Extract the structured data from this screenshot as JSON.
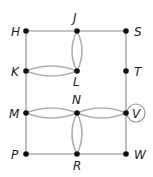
{
  "graph": {
    "colors": {
      "edge": "#b0b0b0",
      "node": "#111111",
      "label": "#222222",
      "highlight_ring": "#999999"
    },
    "nodes": [
      {
        "id": "H",
        "label": "H",
        "x": 26,
        "y": 31,
        "label_dx": -15,
        "label_dy": 5
      },
      {
        "id": "J",
        "label": "J",
        "x": 77,
        "y": 31,
        "label_dx": -4,
        "label_dy": -9
      },
      {
        "id": "S",
        "label": "S",
        "x": 126,
        "y": 31,
        "label_dx": 8,
        "label_dy": 5
      },
      {
        "id": "K",
        "label": "K",
        "x": 26,
        "y": 71,
        "label_dx": -15,
        "label_dy": 5
      },
      {
        "id": "L",
        "label": "L",
        "x": 77,
        "y": 71,
        "label_dx": -4,
        "label_dy": 15
      },
      {
        "id": "T",
        "label": "T",
        "x": 126,
        "y": 71,
        "label_dx": 8,
        "label_dy": 5
      },
      {
        "id": "M",
        "label": "M",
        "x": 26,
        "y": 113,
        "label_dx": -17,
        "label_dy": 5
      },
      {
        "id": "N",
        "label": "N",
        "x": 77,
        "y": 113,
        "label_dx": -5,
        "label_dy": -9
      },
      {
        "id": "V",
        "label": "V",
        "x": 126,
        "y": 113,
        "label_dx": 6,
        "label_dy": 5,
        "circled": true
      },
      {
        "id": "P",
        "label": "P",
        "x": 26,
        "y": 154,
        "label_dx": -15,
        "label_dy": 5
      },
      {
        "id": "R",
        "label": "R",
        "x": 77,
        "y": 154,
        "label_dx": -4,
        "label_dy": 16
      },
      {
        "id": "W",
        "label": "W",
        "x": 126,
        "y": 154,
        "label_dx": 8,
        "label_dy": 5
      }
    ],
    "edges": [
      {
        "from": "H",
        "to": "J"
      },
      {
        "from": "J",
        "to": "S"
      },
      {
        "from": "H",
        "to": "K"
      },
      {
        "from": "K",
        "to": "M"
      },
      {
        "from": "M",
        "to": "P"
      },
      {
        "from": "S",
        "to": "T"
      },
      {
        "from": "T",
        "to": "V"
      },
      {
        "from": "V",
        "to": "W"
      },
      {
        "from": "P",
        "to": "R"
      },
      {
        "from": "R",
        "to": "W"
      },
      {
        "from": "J",
        "to": "L",
        "curve": 5
      },
      {
        "from": "J",
        "to": "L",
        "curve": -5
      },
      {
        "from": "K",
        "to": "L",
        "curve": 5
      },
      {
        "from": "K",
        "to": "L",
        "curve": -5
      },
      {
        "from": "M",
        "to": "N",
        "curve": 5
      },
      {
        "from": "M",
        "to": "N",
        "curve": -5
      },
      {
        "from": "N",
        "to": "V",
        "curve": 5
      },
      {
        "from": "N",
        "to": "V",
        "curve": -5
      },
      {
        "from": "N",
        "to": "R",
        "curve": 5
      },
      {
        "from": "N",
        "to": "R",
        "curve": -5
      }
    ]
  }
}
